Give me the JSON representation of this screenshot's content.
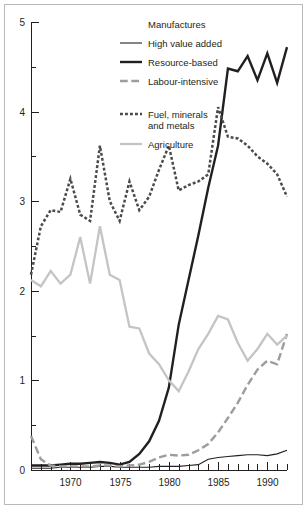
{
  "chart_data": {
    "type": "line",
    "title": "",
    "subtitle": "",
    "xlabel": "",
    "ylabel": "",
    "xlim": [
      1966,
      1992
    ],
    "ylim": [
      0,
      5
    ],
    "grid": false,
    "legend_position": "top-center",
    "legend_title": "Manufactures",
    "y_ticks_major": [
      "0",
      "1",
      "2",
      "3",
      "4",
      "5"
    ],
    "y_ticks_minor": [
      "0.5",
      "1.5",
      "2.5",
      "3.5",
      "4.5"
    ],
    "x_ticks_major": [
      "1970",
      "1975",
      "1980",
      "1985",
      "1990"
    ],
    "x_ticks_minor_step": 1,
    "x": [
      1966,
      1967,
      1968,
      1969,
      1970,
      1971,
      1972,
      1973,
      1974,
      1975,
      1976,
      1977,
      1978,
      1979,
      1980,
      1981,
      1982,
      1983,
      1984,
      1985,
      1986,
      1987,
      1988,
      1989,
      1990,
      1991,
      1992
    ],
    "series": [
      {
        "name": "High value added",
        "style": "solid-thin",
        "color": "#231f20",
        "width": 1.1,
        "values": [
          0.02,
          0.02,
          0.02,
          0.03,
          0.03,
          0.03,
          0.03,
          0.04,
          0.04,
          0.03,
          0.03,
          0.03,
          0.03,
          0.04,
          0.04,
          0.04,
          0.05,
          0.06,
          0.12,
          0.14,
          0.15,
          0.16,
          0.17,
          0.17,
          0.16,
          0.18,
          0.22
        ]
      },
      {
        "name": "Resource-based",
        "style": "solid-thick",
        "color": "#231f20",
        "width": 2.4,
        "values": [
          0.05,
          0.05,
          0.05,
          0.06,
          0.07,
          0.07,
          0.08,
          0.09,
          0.08,
          0.06,
          0.09,
          0.18,
          0.32,
          0.55,
          0.92,
          1.62,
          2.12,
          2.62,
          3.15,
          3.62,
          4.48,
          4.45,
          4.62,
          4.35,
          4.65,
          4.32,
          4.72
        ]
      },
      {
        "name": "Labour-intensive",
        "style": "dashed",
        "color": "#9d9d9d",
        "width": 2.4,
        "values": [
          0.38,
          0.12,
          0.05,
          0.04,
          0.04,
          0.04,
          0.04,
          0.05,
          0.05,
          0.04,
          0.05,
          0.06,
          0.09,
          0.14,
          0.17,
          0.16,
          0.17,
          0.22,
          0.29,
          0.42,
          0.58,
          0.75,
          0.95,
          1.12,
          1.22,
          1.18,
          1.52
        ]
      },
      {
        "name": "Fuel, minerals and metals",
        "style": "dotted",
        "color": "#4d4a4b",
        "width": 2.5,
        "values": [
          2.18,
          2.72,
          2.9,
          2.88,
          3.25,
          2.85,
          2.78,
          3.62,
          3.0,
          2.78,
          3.22,
          2.9,
          3.05,
          3.35,
          3.62,
          3.12,
          3.18,
          3.22,
          3.3,
          4.05,
          3.72,
          3.7,
          3.62,
          3.5,
          3.42,
          3.3,
          3.05
        ]
      },
      {
        "name": "Agriculture",
        "style": "solid-light",
        "color": "#c4c4c4",
        "width": 2.3,
        "values": [
          2.12,
          2.05,
          2.22,
          2.08,
          2.18,
          2.6,
          2.08,
          2.72,
          2.18,
          2.12,
          1.6,
          1.58,
          1.3,
          1.18,
          1.0,
          0.88,
          1.1,
          1.35,
          1.52,
          1.72,
          1.68,
          1.42,
          1.22,
          1.35,
          1.52,
          1.4,
          1.5
        ]
      }
    ],
    "legend_entries": [
      {
        "label": "High value added",
        "style": "solid-thin"
      },
      {
        "label": "Resource-based",
        "style": "solid-thick"
      },
      {
        "label": "Labour-intensive",
        "style": "dashed"
      },
      {
        "label": "Fuel, minerals",
        "label2": "and metals",
        "style": "dotted"
      },
      {
        "label": "Agriculture",
        "style": "solid-light"
      }
    ]
  }
}
